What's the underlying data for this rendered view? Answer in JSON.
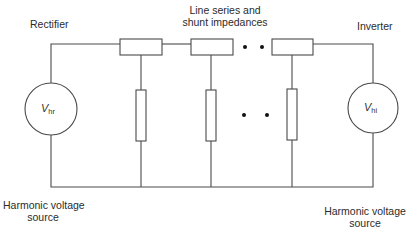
{
  "labels": {
    "rectifier": "Rectifier",
    "inverter": "Inverter",
    "line_impedances_line1": "Line series and",
    "line_impedances_line2": "shunt impedances",
    "left_source_line1": "Harmonic voltage",
    "left_source_line2": "source",
    "right_source_line1": "Harmonic voltage",
    "right_source_line2": "source"
  },
  "sources": {
    "left": {
      "symbol": "V",
      "subscript": "hr"
    },
    "right": {
      "symbol": "V",
      "subscript": "hi"
    }
  },
  "components": {
    "series_impedances": 3,
    "shunt_impedances": 3,
    "ellipsis": "• •"
  },
  "colors": {
    "line": "#4a4a4a",
    "text": "#2b2b2b",
    "dot": "#111111",
    "background": "#ffffff"
  }
}
